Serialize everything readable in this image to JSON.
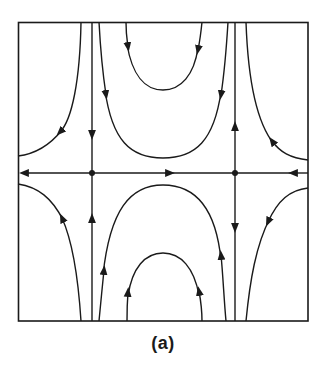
{
  "figure": {
    "caption": "(a)",
    "type": "phase-portrait",
    "stroke_color": "#1a1a1a",
    "background_color": "#ffffff",
    "frame": {
      "x1": 18,
      "y1": 22,
      "x2": 308,
      "y2": 321
    },
    "saddle_points": [
      {
        "name": "left-saddle",
        "x": 92,
        "y": 173
      },
      {
        "name": "right-saddle",
        "x": 235,
        "y": 173
      }
    ],
    "separatrices": {
      "horizontal_axis_y": 173,
      "left_vertical_x": 92,
      "right_vertical_x": 235
    }
  }
}
